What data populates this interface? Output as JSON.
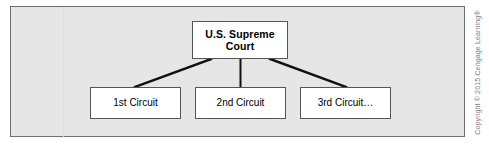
{
  "figure": {
    "kind": "hierarchy-diagram",
    "panel": {
      "background_color": "#e6e6e6",
      "border_color": "#6f6f6f"
    }
  },
  "nodes": {
    "root": {
      "id": "supreme-court",
      "label": "U.S. Supreme Court",
      "label_line_1": "U.S. Supreme",
      "label_line_2": "Court",
      "bold": true,
      "fill_color": "#ffffff",
      "border_color": "#555555"
    },
    "children": [
      {
        "id": "circuit-1",
        "label": "1st Circuit",
        "fill_color": "#ffffff",
        "border_color": "#555555"
      },
      {
        "id": "circuit-2",
        "label": "2nd Circuit",
        "fill_color": "#ffffff",
        "border_color": "#555555"
      },
      {
        "id": "circuit-3",
        "label": "3rd Circuit…",
        "fill_color": "#ffffff",
        "border_color": "#555555"
      }
    ]
  },
  "connectors": {
    "color": "#111111",
    "count": 3,
    "description": "Three straight lines from the bottom edge of the U.S. Supreme Court box down to the top edge of each circuit box"
  },
  "credit": {
    "text": "Copyright © 2015 Cengage Learning®",
    "orientation": "vertical",
    "color": "#7d7d7d"
  }
}
